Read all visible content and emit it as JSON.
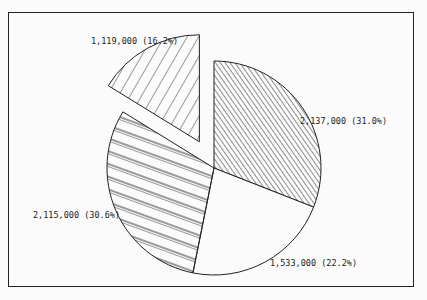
{
  "chart_data": {
    "type": "pie",
    "title": "",
    "slices": [
      {
        "label": "2,137,000 (31.0%)",
        "value": 2137000,
        "percent": 31.0,
        "pattern": "dense-diagonal",
        "exploded": false
      },
      {
        "label": "1,533,000 (22.2%)",
        "value": 1533000,
        "percent": 22.2,
        "pattern": "none",
        "exploded": false
      },
      {
        "label": "2,115,000 (30.6%)",
        "value": 2115000,
        "percent": 30.6,
        "pattern": "wide-double-diagonal",
        "exploded": false
      },
      {
        "label": "1,119,000 (16.2%)",
        "value": 1119000,
        "percent": 16.2,
        "pattern": "wide-back-diagonal",
        "exploded": true
      }
    ],
    "start_angle_deg": 0,
    "direction": "clockwise",
    "legend": "none"
  },
  "layout": {
    "cx": 214,
    "cy": 168,
    "r": 107,
    "explode_offset": 30,
    "label_positions": [
      {
        "x": 300,
        "y": 124
      },
      {
        "x": 270,
        "y": 266
      },
      {
        "x": 33,
        "y": 218
      },
      {
        "x": 91,
        "y": 44
      }
    ]
  },
  "colors": {
    "stroke": "#222222",
    "background": "#fbfbfb"
  }
}
